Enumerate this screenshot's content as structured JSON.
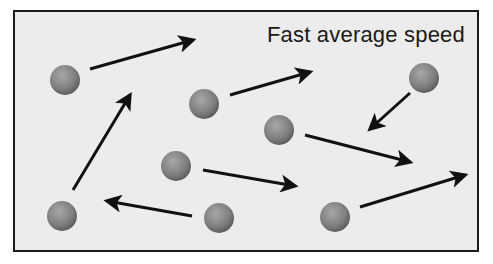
{
  "diagram": {
    "label": "Fast average speed",
    "colors": {
      "background": "#ececec",
      "border": "#1a1a1a",
      "particle": "#8a8a8a",
      "arrow": "#111111"
    },
    "particles": [
      {
        "cx": 65,
        "cy": 80
      },
      {
        "cx": 204,
        "cy": 104
      },
      {
        "cx": 424,
        "cy": 78
      },
      {
        "cx": 279,
        "cy": 130
      },
      {
        "cx": 176,
        "cy": 166
      },
      {
        "cx": 62,
        "cy": 216
      },
      {
        "cx": 219,
        "cy": 218
      },
      {
        "cx": 335,
        "cy": 217
      }
    ],
    "arrows": [
      {
        "x1": 90,
        "y1": 69,
        "x2": 193,
        "y2": 40
      },
      {
        "x1": 230,
        "y1": 95,
        "x2": 310,
        "y2": 72
      },
      {
        "x1": 410,
        "y1": 93,
        "x2": 370,
        "y2": 129
      },
      {
        "x1": 305,
        "y1": 135,
        "x2": 410,
        "y2": 162
      },
      {
        "x1": 73,
        "y1": 190,
        "x2": 130,
        "y2": 95
      },
      {
        "x1": 203,
        "y1": 170,
        "x2": 295,
        "y2": 186
      },
      {
        "x1": 192,
        "y1": 216,
        "x2": 107,
        "y2": 201
      },
      {
        "x1": 360,
        "y1": 207,
        "x2": 465,
        "y2": 175
      }
    ]
  }
}
